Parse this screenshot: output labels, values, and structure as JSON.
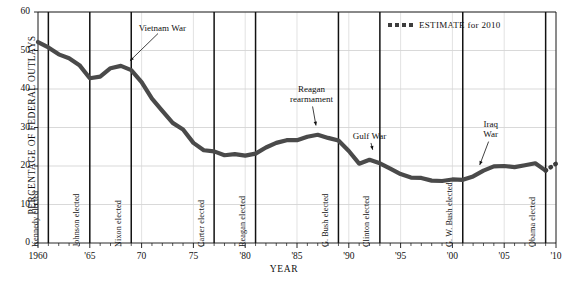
{
  "chart_data": {
    "type": "line",
    "title": "",
    "xlabel": "YEAR",
    "ylabel": "PERCENTAGE OF FEDERAL OUTLAYS",
    "xlim": [
      1960,
      2010
    ],
    "ylim": [
      0,
      60
    ],
    "grid": true,
    "y_ticks": [
      0,
      10,
      20,
      30,
      40,
      50,
      60
    ],
    "y_tick_labels": [
      "0",
      "10",
      "20",
      "30",
      "40",
      "50",
      "60"
    ],
    "x_ticks": [
      1960,
      1965,
      1970,
      1975,
      1980,
      1985,
      1990,
      1995,
      2000,
      2005,
      2010
    ],
    "x_tick_labels": [
      "1960",
      "'65",
      "70",
      "75",
      "'80",
      "'85",
      "'90",
      "'95",
      "'00",
      "'05",
      "'10"
    ],
    "x_minor_step": 1,
    "series": [
      {
        "name": "Defense share of federal outlays",
        "style": "solid",
        "color": "#4a4a4a",
        "x": [
          1960,
          1961,
          1962,
          1963,
          1964,
          1965,
          1966,
          1967,
          1968,
          1969,
          1970,
          1971,
          1972,
          1973,
          1974,
          1975,
          1976,
          1977,
          1978,
          1979,
          1980,
          1981,
          1982,
          1983,
          1984,
          1985,
          1986,
          1987,
          1988,
          1989,
          1990,
          1991,
          1992,
          1993,
          1994,
          1995,
          1996,
          1997,
          1998,
          1999,
          2000,
          2001,
          2002,
          2003,
          2004,
          2005,
          2006,
          2007,
          2008,
          2009
        ],
        "y": [
          52.2,
          50.8,
          49.0,
          48.0,
          46.2,
          42.8,
          43.2,
          45.4,
          46.0,
          44.9,
          41.8,
          37.5,
          34.3,
          31.2,
          29.5,
          26.0,
          24.1,
          23.8,
          22.8,
          23.1,
          22.7,
          23.2,
          24.8,
          26.0,
          26.7,
          26.7,
          27.6,
          28.1,
          27.3,
          26.6,
          23.9,
          20.6,
          21.6,
          20.7,
          19.3,
          17.9,
          17.0,
          16.9,
          16.2,
          16.1,
          16.5,
          16.4,
          17.3,
          18.8,
          19.9,
          20.0,
          19.7,
          20.2,
          20.7,
          18.8
        ]
      },
      {
        "name": "ESTIMATE for 2010",
        "style": "dotted",
        "color": "#3d3d3d",
        "x": [
          2009,
          2010
        ],
        "y": [
          18.8,
          20.6
        ]
      }
    ],
    "legend": {
      "position": "top-right",
      "entries": [
        {
          "label": "ESTIMATE for 2010",
          "style": "dotted"
        }
      ]
    },
    "event_lines": [
      {
        "year": 1961,
        "label": "Kennedy elected"
      },
      {
        "year": 1965,
        "label": "Johnson elected"
      },
      {
        "year": 1969,
        "label": "Nixon elected"
      },
      {
        "year": 1977,
        "label": "Carter elected"
      },
      {
        "year": 1981,
        "label": "Reagan elected"
      },
      {
        "year": 1989,
        "label": "G. Bush elected"
      },
      {
        "year": 1993,
        "label": "Clinton elected"
      },
      {
        "year": 2001,
        "label": "G. W. Bush elected"
      },
      {
        "year": 2009,
        "label": "Obama elected"
      }
    ],
    "annotations": [
      {
        "text": "Vietnam War",
        "text_x": 1972.0,
        "text_y": 55.5,
        "point_x": 1968.6,
        "point_y": 46.6
      },
      {
        "text": "Reagan rearmament",
        "lines": [
          "Reagan",
          "rearmament"
        ],
        "text_x": 1986.4,
        "text_y": 37.0,
        "point_x": 1986.9,
        "point_y": 29.5
      },
      {
        "text": "Gulf War",
        "text_x": 1992.0,
        "text_y": 27.5,
        "point_x": 1992.4,
        "point_y": 23.2
      },
      {
        "text": "Iraq War",
        "lines": [
          "Iraq",
          "War"
        ],
        "text_x": 2003.7,
        "text_y": 27.8,
        "point_x": 2002.5,
        "point_y": 19.3
      }
    ]
  }
}
